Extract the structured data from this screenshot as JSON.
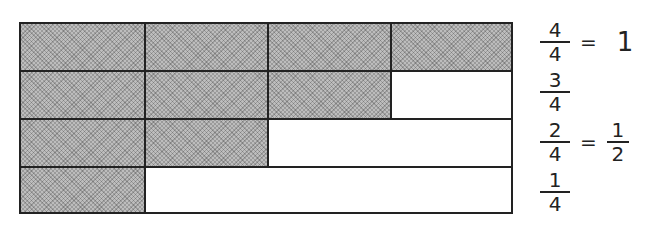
{
  "diagram": {
    "rows": [
      {
        "shaded": 4,
        "total": 4,
        "label": {
          "numerator": "4",
          "denominator": "4",
          "equals": "=",
          "simplified": "1"
        }
      },
      {
        "shaded": 3,
        "total": 4,
        "label": {
          "numerator": "3",
          "denominator": "4"
        }
      },
      {
        "shaded": 2,
        "total": 4,
        "label": {
          "numerator": "2",
          "denominator": "4",
          "equals": "=",
          "simplified_num": "1",
          "simplified_den": "2"
        }
      },
      {
        "shaded": 1,
        "total": 4,
        "label": {
          "numerator": "1",
          "denominator": "4"
        }
      }
    ],
    "colors": {
      "shade": "#bdbdbd",
      "line": "#222222",
      "background": "#ffffff"
    }
  }
}
